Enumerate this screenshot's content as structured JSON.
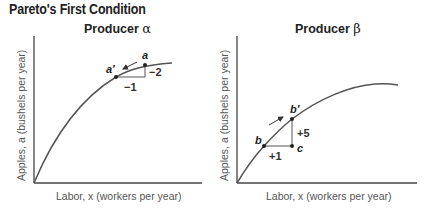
{
  "title": "Pareto's First Condition",
  "panels": [
    {
      "id": "alpha",
      "title_text": "Producer ",
      "title_symbol": "α",
      "xlabel": "Labor, x (workers per year)",
      "ylabel": "Apples, a (bushels per year)",
      "points": [
        {
          "label": "a",
          "role": "upper"
        },
        {
          "label": "a'",
          "role": "lower"
        }
      ],
      "changes": {
        "dx": "−1",
        "dy": "−2"
      },
      "arrow_direction": "down-left along curve"
    },
    {
      "id": "beta",
      "title_text": "Producer ",
      "title_symbol": "β",
      "xlabel": "Labor, x (workers per year)",
      "ylabel": "Apples, a (bushels per year)",
      "points": [
        {
          "label": "b",
          "role": "lower"
        },
        {
          "label": "b'",
          "role": "upper"
        },
        {
          "label": "c",
          "role": "corner"
        }
      ],
      "changes": {
        "dx": "+1",
        "dy": "+5"
      },
      "arrow_direction": "up-right along curve"
    }
  ],
  "colors": {
    "curve": "#555555",
    "axis": "#444444",
    "text": "#222222"
  }
}
